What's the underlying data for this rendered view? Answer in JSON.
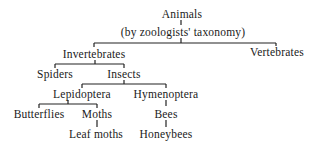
{
  "diagram": {
    "nodes": {
      "animals": "Animals",
      "taxonomy": "(by zoologists' taxonomy)",
      "invertebrates": "Invertebrates",
      "vertebrates": "Vertebrates",
      "spiders": "Spiders",
      "insects": "Insects",
      "lepidoptera": "Lepidoptera",
      "hymenoptera": "Hymenoptera",
      "butterflies": "Butterflies",
      "moths": "Moths",
      "bees": "Bees",
      "leaf_moths": "Leaf moths",
      "honeybees": "Honeybees"
    },
    "edges": [
      [
        "animals",
        "invertebrates"
      ],
      [
        "animals",
        "vertebrates"
      ],
      [
        "invertebrates",
        "spiders"
      ],
      [
        "invertebrates",
        "insects"
      ],
      [
        "insects",
        "lepidoptera"
      ],
      [
        "insects",
        "hymenoptera"
      ],
      [
        "lepidoptera",
        "butterflies"
      ],
      [
        "lepidoptera",
        "moths"
      ],
      [
        "moths",
        "leaf_moths"
      ],
      [
        "hymenoptera",
        "bees"
      ],
      [
        "bees",
        "honeybees"
      ]
    ]
  }
}
